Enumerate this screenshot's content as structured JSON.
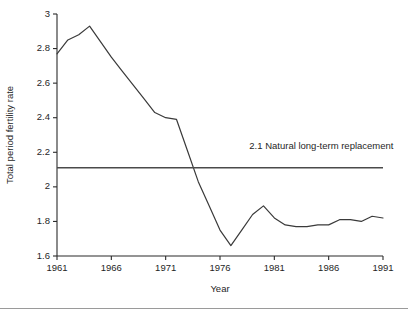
{
  "chart_data": {
    "type": "line",
    "title": "",
    "subtitle": "",
    "xlabel": "Year",
    "ylabel": "Total period fertility rate",
    "xlim": [
      1961,
      1991
    ],
    "ylim": [
      1.6,
      3.0
    ],
    "grid": false,
    "legend_position": "none",
    "x_ticks": [
      "1961",
      "1966",
      "1971",
      "1976",
      "1981",
      "1986",
      "1991"
    ],
    "x_tick_values": [
      1961,
      1966,
      1971,
      1976,
      1981,
      1986,
      1991
    ],
    "y_ticks": [
      "1.6",
      "1.8",
      "2",
      "2.2",
      "2.4",
      "2.6",
      "2.8",
      "3"
    ],
    "y_tick_values": [
      1.6,
      1.8,
      2.0,
      2.2,
      2.4,
      2.6,
      2.8,
      3.0
    ],
    "x": [
      1961,
      1962,
      1963,
      1964,
      1965,
      1966,
      1967,
      1968,
      1969,
      1970,
      1971,
      1972,
      1973,
      1974,
      1975,
      1976,
      1977,
      1978,
      1979,
      1980,
      1981,
      1982,
      1983,
      1984,
      1985,
      1986,
      1987,
      1988,
      1989,
      1990,
      1991
    ],
    "series": [
      {
        "name": "Total period fertility rate",
        "color": "#3a3a3a",
        "values": [
          2.77,
          2.85,
          2.88,
          2.93,
          2.84,
          2.75,
          2.67,
          2.59,
          2.51,
          2.43,
          2.4,
          2.39,
          2.21,
          2.03,
          1.89,
          1.75,
          1.66,
          1.75,
          1.84,
          1.89,
          1.82,
          1.78,
          1.77,
          1.77,
          1.78,
          1.78,
          1.81,
          1.81,
          1.8,
          1.83,
          1.82
        ]
      }
    ],
    "annotations": [
      {
        "name": "replacement-level-line",
        "label": "2.1 Natural long-term replacement",
        "value": 2.11,
        "color": "#4a4a4a",
        "orientation": "horizontal",
        "label_x": 1978.7,
        "label_y": 2.22
      }
    ]
  }
}
